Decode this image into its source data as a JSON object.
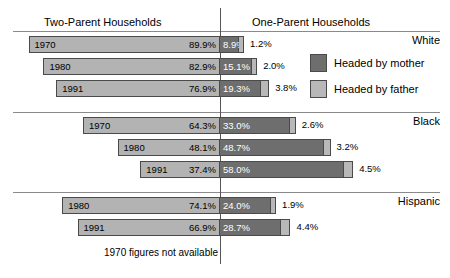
{
  "header": {
    "left_title": "Two-Parent Households",
    "right_title": "One-Parent Households"
  },
  "legend": {
    "mother": "Headed by mother",
    "father": "Headed by father"
  },
  "footnote": "1970 figures not available",
  "groups": [
    {
      "label": "White"
    },
    {
      "label": "Black"
    },
    {
      "label": "Hispanic"
    }
  ],
  "rows": [
    {
      "group": "White",
      "year": "1970",
      "two": "89.9%",
      "mother": "8.9%",
      "father": "1.2%"
    },
    {
      "group": "White",
      "year": "1980",
      "two": "82.9%",
      "mother": "15.1%",
      "father": "2.0%"
    },
    {
      "group": "White",
      "year": "1991",
      "two": "76.9%",
      "mother": "19.3%",
      "father": "3.8%"
    },
    {
      "group": "Black",
      "year": "1970",
      "two": "64.3%",
      "mother": "33.0%",
      "father": "2.6%"
    },
    {
      "group": "Black",
      "year": "1980",
      "two": "48.1%",
      "mother": "48.7%",
      "father": "3.2%"
    },
    {
      "group": "Black",
      "year": "1991",
      "two": "37.4%",
      "mother": "58.0%",
      "father": "4.5%"
    },
    {
      "group": "Hispanic",
      "year": "1980",
      "two": "74.1%",
      "mother": "24.0%",
      "father": "1.9%"
    },
    {
      "group": "Hispanic",
      "year": "1991",
      "two": "66.9%",
      "mother": "28.7%",
      "father": "4.4%"
    }
  ],
  "chart_data": {
    "type": "bar",
    "title": "",
    "subtitle": "",
    "orientation": "horizontal",
    "layout": "diverging-stacked",
    "divider_label_left": "Two-Parent Households",
    "divider_label_right": "One-Parent Households",
    "xlabel": "",
    "ylabel": "",
    "grid": false,
    "legend_position": "right",
    "legend_entries": [
      "Headed by mother",
      "Headed by father"
    ],
    "annotations": [
      "1970 figures not available"
    ],
    "categories": [
      "White 1970",
      "White 1980",
      "White 1991",
      "Black 1970",
      "Black 1980",
      "Black 1991",
      "Hispanic 1980",
      "Hispanic 1991"
    ],
    "series": [
      {
        "name": "Two-Parent Households",
        "side": "left",
        "values": [
          89.9,
          82.9,
          76.9,
          64.3,
          48.1,
          37.4,
          74.1,
          66.9
        ]
      },
      {
        "name": "Headed by mother",
        "side": "right",
        "values": [
          8.9,
          15.1,
          19.3,
          33.0,
          48.7,
          58.0,
          24.0,
          28.7
        ]
      },
      {
        "name": "Headed by father",
        "side": "right",
        "values": [
          1.2,
          2.0,
          3.8,
          2.6,
          3.2,
          4.5,
          1.9,
          4.4
        ]
      }
    ],
    "units": "percent",
    "xlim": [
      0,
      100
    ]
  }
}
